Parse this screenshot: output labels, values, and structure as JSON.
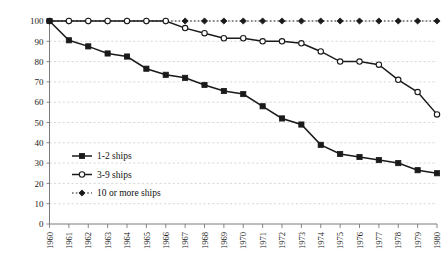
{
  "chart_data": {
    "type": "line",
    "title": "",
    "subtitle": "",
    "xlabel": "",
    "ylabel": "",
    "xlim": [
      1960,
      1980
    ],
    "ylim": [
      0,
      100
    ],
    "grid": true,
    "legend_position": "inside-left-lower",
    "categories": [
      1960,
      1961,
      1962,
      1963,
      1964,
      1965,
      1966,
      1967,
      1968,
      1969,
      1970,
      1971,
      1972,
      1973,
      1974,
      1975,
      1976,
      1977,
      1978,
      1979,
      1980
    ],
    "x_tick_labels": [
      "1960",
      "1961",
      "1962",
      "1963",
      "1964",
      "1965",
      "1966",
      "1967",
      "1968",
      "1969",
      "1970",
      "1971",
      "1972",
      "1973",
      "1974",
      "1975",
      "1976",
      "1977",
      "1978",
      "1979",
      "1980"
    ],
    "y_tick_labels": [
      "0",
      "10",
      "20",
      "30",
      "40",
      "50",
      "60",
      "70",
      "80",
      "90",
      "100"
    ],
    "y_ticks": [
      0,
      10,
      20,
      30,
      40,
      50,
      60,
      70,
      80,
      90,
      100
    ],
    "series": [
      {
        "name": "1-2 ships",
        "marker": "filled-square",
        "line_style": "solid",
        "color": "#1a1a1a",
        "values": [
          100,
          90.5,
          87.5,
          84,
          82.5,
          76.5,
          73.5,
          72,
          68.5,
          65.5,
          64,
          58,
          52,
          49,
          39,
          34.5,
          33,
          31.5,
          30,
          26.5,
          25
        ]
      },
      {
        "name": "3-9 ships",
        "marker": "open-circle",
        "line_style": "solid",
        "color": "#1a1a1a",
        "values": [
          100,
          100,
          100,
          100,
          100,
          100,
          100,
          96.5,
          94,
          91.5,
          91.5,
          90,
          90,
          89,
          85,
          80,
          80,
          78.5,
          71,
          65,
          54
        ]
      },
      {
        "name": "10 or more ships",
        "marker": "filled-diamond",
        "line_style": "dotted",
        "color": "#1a1a1a",
        "values": [
          100,
          100,
          100,
          100,
          100,
          100,
          100,
          100,
          100,
          100,
          100,
          100,
          100,
          100,
          100,
          100,
          100,
          100,
          100,
          100,
          100
        ]
      }
    ],
    "legend": [
      {
        "label": "1-2 ships",
        "marker": "filled-square",
        "line_style": "solid"
      },
      {
        "label": "3-9 ships",
        "marker": "open-circle",
        "line_style": "solid"
      },
      {
        "label": "10 or more ships",
        "marker": "filled-diamond",
        "line_style": "dotted"
      }
    ]
  },
  "colors": {
    "ink": "#1a1a1a",
    "axis": "#7a7a7a",
    "grid": "#c9c9c9",
    "background": "#ffffff"
  }
}
